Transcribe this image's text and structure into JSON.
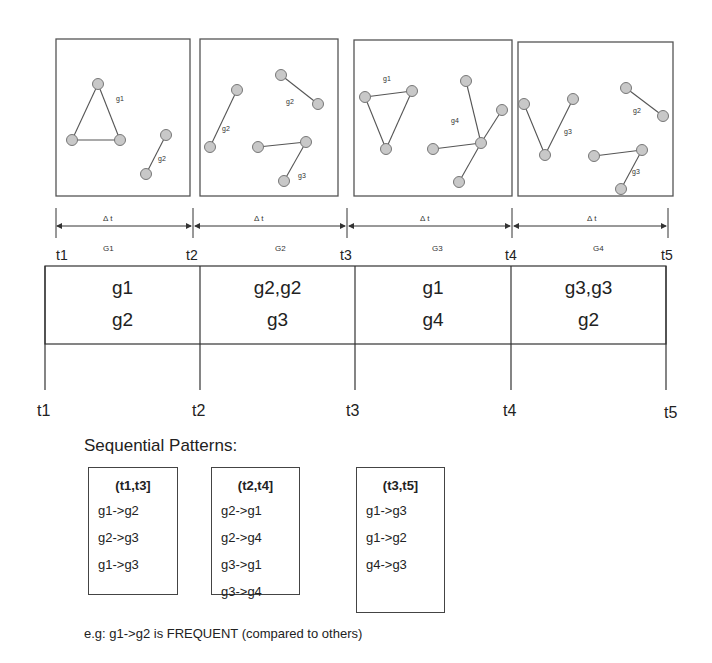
{
  "graph_panels": [
    {
      "id": "G1",
      "graphs": [
        {
          "label": "g1"
        },
        {
          "label": "g2"
        }
      ]
    },
    {
      "id": "G2",
      "graphs": [
        {
          "label": "g2"
        },
        {
          "label": "g2"
        },
        {
          "label": "g3"
        }
      ]
    },
    {
      "id": "G3",
      "graphs": [
        {
          "label": "g1"
        },
        {
          "label": "g4"
        }
      ]
    },
    {
      "id": "G4",
      "graphs": [
        {
          "label": "g3"
        },
        {
          "label": "g2"
        },
        {
          "label": "g3"
        }
      ]
    }
  ],
  "interval_axis": {
    "delta_label": "Δ t",
    "intervals": [
      {
        "delta": "Δ t",
        "group": "G1"
      },
      {
        "delta": "Δ t",
        "group": "G2"
      },
      {
        "delta": "Δ t",
        "group": "G3"
      },
      {
        "delta": "Δ t",
        "group": "G4"
      }
    ],
    "ticks": [
      "t1",
      "t2",
      "t3",
      "t4",
      "t5"
    ]
  },
  "timeline_table": {
    "cells": [
      {
        "line1": "g1",
        "line2": "g2"
      },
      {
        "line1": "g2,g2",
        "line2": "g3"
      },
      {
        "line1": "g1",
        "line2": "g4"
      },
      {
        "line1": "g3,g3",
        "line2": "g2"
      }
    ],
    "ticks": [
      "t1",
      "t2",
      "t3",
      "t4",
      "t5"
    ]
  },
  "sequential_patterns": {
    "title": "Sequential Patterns:",
    "windows": [
      {
        "header": "(t1,t3]",
        "patterns": [
          "g1->g2",
          "g2->g3",
          "g1->g3"
        ]
      },
      {
        "header": "(t2,t4]",
        "patterns": [
          "g2->g1",
          "g2->g4",
          "g3->g1",
          "g3->g4"
        ]
      },
      {
        "header": "(t3,t5]",
        "patterns": [
          "g1->g3",
          "g1->g2",
          "g4->g3"
        ]
      }
    ]
  },
  "note": "e.g: g1->g2 is FREQUENT (compared to others)",
  "colors": {
    "node_fill": "#c8c8c8",
    "node_stroke": "#777777",
    "line": "#444444"
  }
}
